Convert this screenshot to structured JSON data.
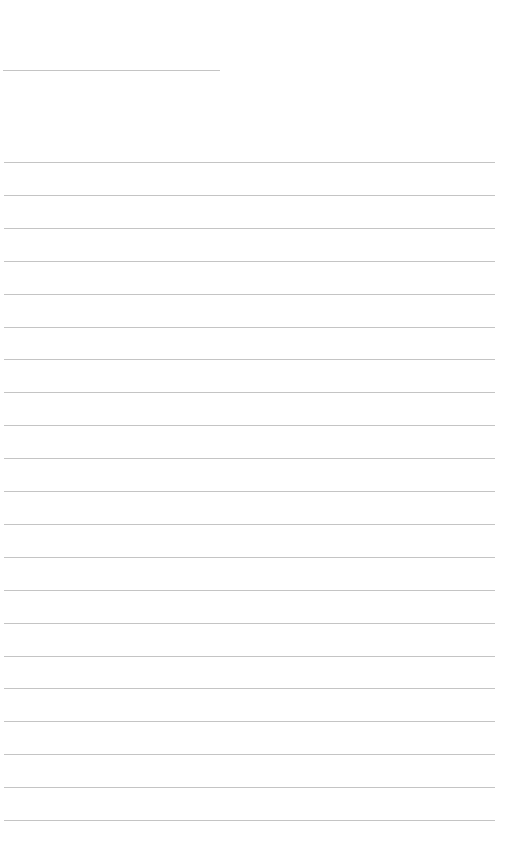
{
  "page": {
    "background": "#ffffff",
    "line_color": "#c4c4c4",
    "title_rule": {
      "top": 70,
      "left": 3,
      "width": 217
    },
    "writing_lines": {
      "count": 21,
      "first_top": 162,
      "spacing": 32.9,
      "left": 4,
      "width": 491
    }
  }
}
